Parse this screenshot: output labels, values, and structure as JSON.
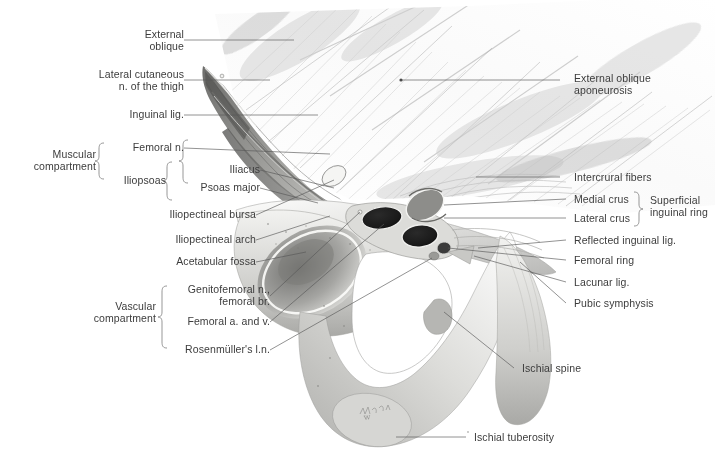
{
  "figure": {
    "signature": "F. Wolfe",
    "background_color": "#ffffff",
    "text_color": "#3c3c3c",
    "leader_color": "#585858"
  },
  "labels_left": [
    {
      "id": "external-oblique",
      "text": "External\noblique"
    },
    {
      "id": "lateral-cutaneous-nerve",
      "text": "Lateral cutaneous\nn. of the thigh"
    },
    {
      "id": "inguinal-ligament",
      "text": "Inguinal lig."
    },
    {
      "id": "femoral-nerve",
      "text": "Femoral n."
    },
    {
      "id": "iliopsoas",
      "text": "Iliopsoas"
    },
    {
      "id": "iliacus",
      "text": "Iliacus"
    },
    {
      "id": "psoas-major",
      "text": "Psoas major"
    },
    {
      "id": "iliopectineal-bursa",
      "text": "Iliopectineal bursa"
    },
    {
      "id": "iliopectineal-arch",
      "text": "Iliopectineal arch"
    },
    {
      "id": "acetabular-fossa",
      "text": "Acetabular fossa"
    },
    {
      "id": "genitofemoral-nerve",
      "text": "Genitofemoral n.,\nfemoral br."
    },
    {
      "id": "femoral-artery-vein",
      "text": "Femoral a. and v."
    },
    {
      "id": "rosenmuller-node",
      "text": "Rosenmüller's l.n."
    }
  ],
  "brackets_left": [
    {
      "id": "muscular-compartment",
      "text": "Muscular\ncompartment"
    },
    {
      "id": "vascular-compartment",
      "text": "Vascular\ncompartment"
    }
  ],
  "labels_right": [
    {
      "id": "external-oblique-aponeurosis",
      "text": "External oblique\naponeurosis"
    },
    {
      "id": "intercrural-fibers",
      "text": "Intercrural fibers"
    },
    {
      "id": "medial-crus",
      "text": "Medial crus"
    },
    {
      "id": "lateral-crus",
      "text": "Lateral crus"
    },
    {
      "id": "reflected-inguinal-ligament",
      "text": "Reflected inguinal lig."
    },
    {
      "id": "femoral-ring",
      "text": "Femoral ring"
    },
    {
      "id": "lacunar-ligament",
      "text": "Lacunar lig."
    },
    {
      "id": "pubic-symphysis",
      "text": "Pubic symphysis"
    },
    {
      "id": "ischial-spine",
      "text": "Ischial spine"
    },
    {
      "id": "ischial-tuberosity",
      "text": "Ischial tuberosity"
    }
  ],
  "brackets_right": [
    {
      "id": "superficial-inguinal-ring",
      "text": "Superficial\ninguinal ring"
    }
  ]
}
